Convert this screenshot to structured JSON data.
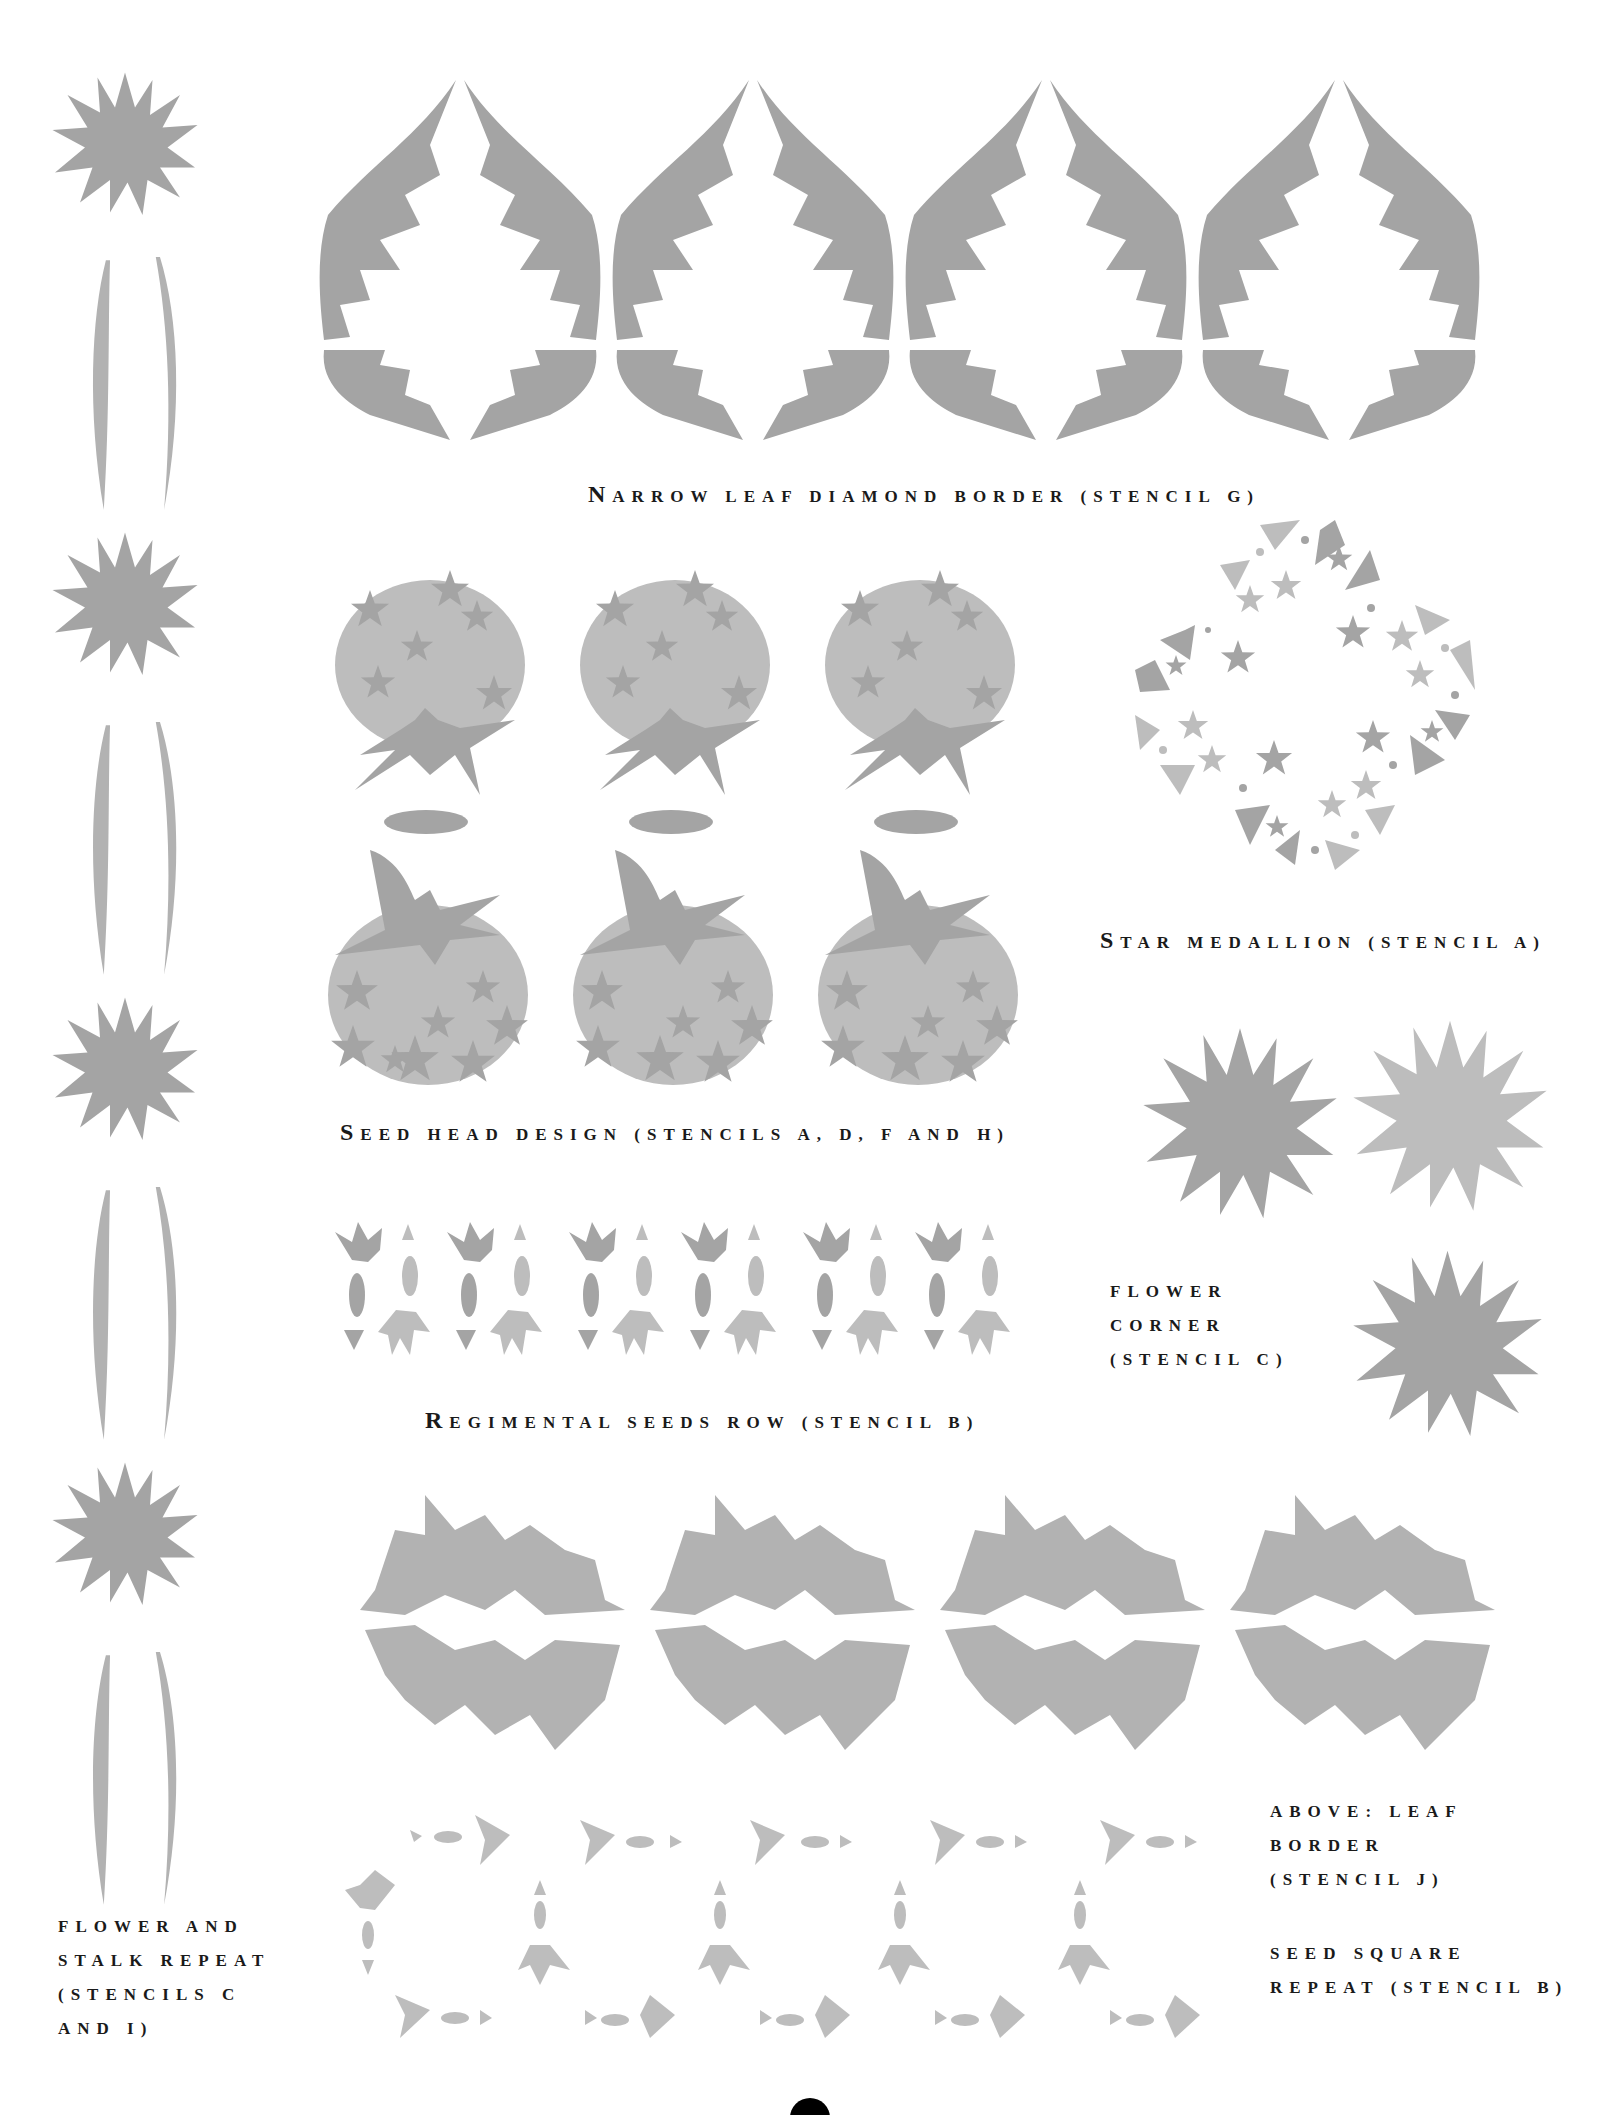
{
  "page": {
    "background": "#ffffff",
    "stencil_gray": "#a4a4a4",
    "text_color": "#1a1a1a"
  },
  "captions": {
    "narrow_leaf": {
      "first": "N",
      "rest": "arrow leaf diamond border (stencil G)"
    },
    "star_medallion": {
      "first": "S",
      "rest": "tar medallion (stencil A)"
    },
    "seed_head": {
      "first": "S",
      "rest": "eed head design (stencils A, D, F and H)"
    },
    "flower_corner": {
      "lines": [
        "Flower",
        "corner",
        "(stencil C)"
      ]
    },
    "regimental": {
      "first": "R",
      "rest": "egimental seeds row (stencil B)"
    },
    "flower_stalk": {
      "lines": [
        "Flower and",
        "stalk repeat",
        "(stencils C",
        "and I)"
      ]
    },
    "leaf_border": {
      "lines": [
        "Above: Leaf",
        "border",
        "(stencil J)"
      ]
    },
    "seed_square": {
      "lines": [
        "Seed square",
        "repeat (stencil B)"
      ]
    }
  },
  "illustrations": {
    "flower_stalk_column": {
      "repeats": 4,
      "icon": "flower-stalk-icon"
    },
    "narrow_leaf_border": {
      "repeats": 4,
      "icon": "leaf-diamond-icon"
    },
    "seed_heads_top": {
      "repeats": 3,
      "icon": "seed-head-icon"
    },
    "seed_heads_bottom": {
      "repeats": 3,
      "icon": "seed-head-icon"
    },
    "star_medallion": {
      "icon": "star-medallion-icon"
    },
    "flower_corner": {
      "repeats": 3,
      "icon": "flower-icon"
    },
    "regimental_row": {
      "repeats": 6,
      "icon": "seed-row-icon"
    },
    "leaf_border": {
      "repeats": 4,
      "icon": "leaf-border-icon"
    },
    "seed_square": {
      "icon": "seed-square-icon"
    }
  }
}
